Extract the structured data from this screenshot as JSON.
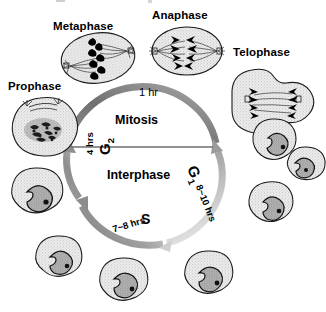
{
  "diagram": {
    "title_visible": false,
    "center_labels": {
      "mitosis": "Mitosis",
      "interphase": "Interphase"
    },
    "mitosis_phases": [
      {
        "name": "prophase",
        "label": "Prophase"
      },
      {
        "name": "metaphase",
        "label": "Metaphase"
      },
      {
        "name": "anaphase",
        "label": "Anaphase"
      },
      {
        "name": "telophase",
        "label": "Telophase"
      }
    ],
    "arc_segments": [
      {
        "name": "mitosis",
        "label": "1 hr",
        "duration": "1 hr"
      },
      {
        "name": "g1",
        "label": "G",
        "subscript": "1",
        "duration": "8~10 hrs"
      },
      {
        "name": "s",
        "label": "S",
        "duration": "7~8 hrs"
      },
      {
        "name": "g2",
        "label": "G",
        "subscript": "2",
        "duration": "4 hrs"
      }
    ],
    "colors": {
      "arrow": "#8a8a8a",
      "arrow_light": "#d8d8d8",
      "ink": "#000000",
      "cell_fill": "#efefef",
      "nucleus_fill": "#bdbdbd",
      "divider": "#6e6e6e"
    },
    "cell_count_interphase": 7,
    "cell_count_mitotic": 4
  }
}
